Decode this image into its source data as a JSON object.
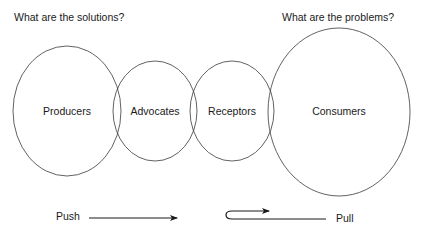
{
  "headings": {
    "solutions": "What are the solutions?",
    "problems": "What are the problems?"
  },
  "circles": [
    {
      "id": "producers",
      "label": "Producers",
      "cx": 67,
      "cy": 111,
      "rx": 54,
      "ry": 65
    },
    {
      "id": "advocates",
      "label": "Advocates",
      "cx": 155,
      "cy": 111,
      "rx": 42,
      "ry": 50
    },
    {
      "id": "receptors",
      "label": "Receptors",
      "cx": 232,
      "cy": 111,
      "rx": 42,
      "ry": 50
    },
    {
      "id": "consumers",
      "label": "Consumers",
      "cx": 339,
      "cy": 112,
      "rx": 71,
      "ry": 84
    }
  ],
  "arrows": {
    "push": {
      "label": "Push",
      "direction": "right"
    },
    "pull": {
      "label": "Pull",
      "direction": "hooked-right"
    }
  },
  "colors": {
    "stroke": "#3a3a3a",
    "text": "#1a1a1a",
    "background": "#ffffff"
  }
}
